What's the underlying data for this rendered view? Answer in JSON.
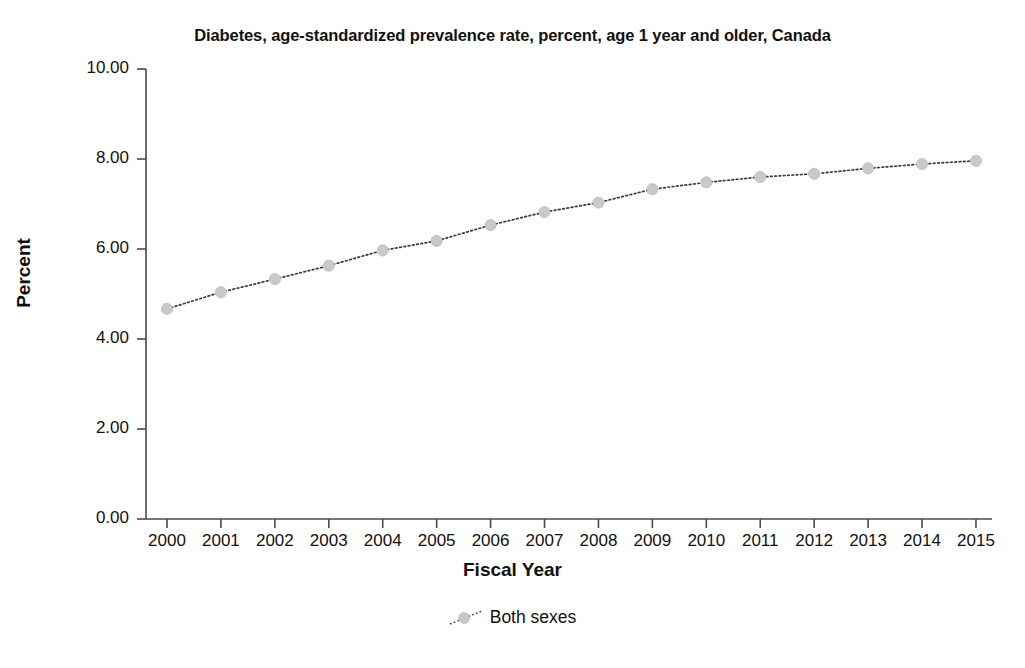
{
  "chart_data": {
    "type": "line",
    "title": "Diabetes, age-standardized prevalence rate, percent, age 1 year and older, Canada",
    "xlabel": "Fiscal Year",
    "ylabel": "Percent",
    "categories": [
      "2000",
      "2001",
      "2002",
      "2003",
      "2004",
      "2005",
      "2006",
      "2007",
      "2008",
      "2009",
      "2010",
      "2011",
      "2012",
      "2013",
      "2014",
      "2015"
    ],
    "x_tick_labels": [
      "2000",
      "2001",
      "2002",
      "2003",
      "2004",
      "2005",
      "2006",
      "2007",
      "2008",
      "2009",
      "2010",
      "2011",
      "2012",
      "2013",
      "2014",
      "2015"
    ],
    "y_tick_labels": [
      "10.00",
      "8.00",
      "6.00",
      "4.00",
      "2.00",
      "0.00"
    ],
    "y_ticks": [
      10.0,
      8.0,
      6.0,
      4.0,
      2.0,
      0.0
    ],
    "ylim": [
      0.0,
      10.0
    ],
    "grid": false,
    "legend_position": "bottom-center",
    "series": [
      {
        "name": "Both sexes",
        "marker": "circle",
        "marker_color": "#c9c9c9",
        "line_style": "dotted",
        "line_color": "#3a3a3a",
        "values": [
          4.67,
          5.04,
          5.33,
          5.63,
          5.97,
          6.18,
          6.53,
          6.82,
          7.03,
          7.33,
          7.48,
          7.6,
          7.67,
          7.79,
          7.89,
          7.96
        ]
      }
    ]
  },
  "legend": {
    "entries": [
      {
        "label": "Both sexes"
      }
    ]
  },
  "colors": {
    "marker": "#c9c9c9",
    "line": "#3a3a3a",
    "axis": "#4a4a4a",
    "text": "#111111"
  }
}
